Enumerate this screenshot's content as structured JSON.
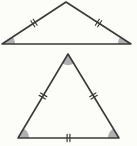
{
  "figure": {
    "canvas": {
      "width": 137,
      "height": 146,
      "background": "#fcfcf9"
    },
    "style": {
      "stroke_color": "#3a3a3a",
      "stroke_width": 1.6,
      "tick_stroke_width": 1.2,
      "tick_half_length": 3.6,
      "tick_spacing": 2.8,
      "angle_fill": "#b0b0b0"
    },
    "triangles": [
      {
        "name": "top-triangle",
        "shape": "wide-isosceles",
        "vertices": [
          [
            66,
            2
          ],
          [
            2,
            44
          ],
          [
            131,
            44
          ]
        ],
        "side_ticks": [
          {
            "from": 1,
            "to": 0,
            "count": 2
          },
          {
            "from": 0,
            "to": 2,
            "count": 2
          }
        ],
        "angle_marks": [
          {
            "vertex": 1,
            "radius": 13
          },
          {
            "vertex": 2,
            "radius": 13
          }
        ]
      },
      {
        "name": "bottom-triangle",
        "shape": "equilateral",
        "vertices": [
          [
            68,
            54
          ],
          [
            18,
            138
          ],
          [
            119,
            138
          ]
        ],
        "side_ticks": [
          {
            "from": 1,
            "to": 0,
            "count": 2
          },
          {
            "from": 0,
            "to": 2,
            "count": 2
          },
          {
            "from": 1,
            "to": 2,
            "count": 2
          }
        ],
        "angle_marks": [
          {
            "vertex": 0,
            "radius": 11
          },
          {
            "vertex": 1,
            "radius": 11
          },
          {
            "vertex": 2,
            "radius": 11
          }
        ]
      }
    ]
  }
}
